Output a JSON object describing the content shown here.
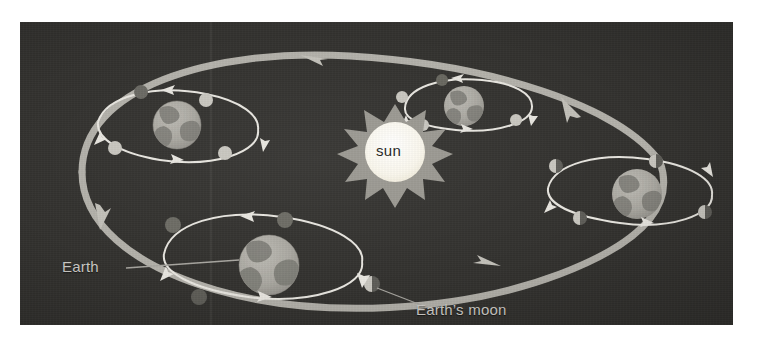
{
  "figure": {
    "kind": "astronomy-diagram",
    "background_color": "#33322f",
    "page_color": "#ffffff"
  },
  "labels": {
    "sun": "sun",
    "earth": "Earth",
    "earth_moon": "Earth’s moon"
  },
  "colors": {
    "sun_core": "#fbf8ee",
    "sun_corona": "#9a9891",
    "earth_ocean": "#a9a7a0",
    "earth_land": "#7c7b75",
    "orbit_band": "#b3b1aa",
    "moon_orbit_line": "#e8e6e0",
    "moon_lit": "#c8c6bf",
    "moon_dark": "#5e5d58",
    "label_text": "#cfcdc8",
    "leader_line": "#a8a6a0"
  },
  "bodies": {
    "sun": {
      "name": "sun",
      "cx": 375,
      "cy": 130,
      "r": 36,
      "spikes": 11
    },
    "earth_positions": [
      {
        "id": "earth-top-left",
        "cx": 157,
        "cy": 103,
        "r": 24,
        "season_hint": "upper-left"
      },
      {
        "id": "earth-top-right",
        "cx": 444,
        "cy": 84,
        "r": 20,
        "season_hint": "upper-right"
      },
      {
        "id": "earth-right",
        "cx": 617,
        "cy": 172,
        "r": 25,
        "season_hint": "right"
      },
      {
        "id": "earth-bottom-left",
        "cx": 249,
        "cy": 243,
        "r": 30,
        "season_hint": "lower-left"
      }
    ],
    "moons_per_earth": 4,
    "moon_radius": 7
  },
  "orbits": {
    "earth_orbit": {
      "name": "Earth orbit around sun",
      "style": "thick ribbon ellipse with arrowheads",
      "stroke_width": 7,
      "arrowheads": 4,
      "direction": "counter-clockwise"
    },
    "moon_orbit": {
      "name": "Moon orbit around Earth",
      "style": "thin white ellipse with arrowheads",
      "stroke_width": 2,
      "arrowheads_per_orbit": 3,
      "direction": "counter-clockwise"
    }
  }
}
